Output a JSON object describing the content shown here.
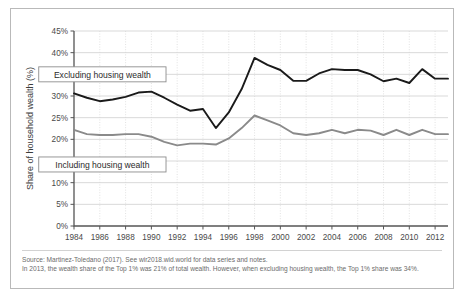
{
  "chart_data": {
    "type": "line",
    "title": "",
    "xlabel": "",
    "ylabel": "Share of household wealth (%)",
    "xlim": [
      1984,
      2013
    ],
    "ylim": [
      0,
      45
    ],
    "grid": true,
    "legend_position": "inline-annotation",
    "x": [
      1984,
      1985,
      1986,
      1987,
      1988,
      1989,
      1990,
      1991,
      1992,
      1993,
      1994,
      1995,
      1996,
      1997,
      1998,
      1999,
      2000,
      2001,
      2002,
      2003,
      2004,
      2005,
      2006,
      2007,
      2008,
      2009,
      2010,
      2011,
      2012,
      2013
    ],
    "x_tick_labels": [
      "1984",
      "1986",
      "1988",
      "1990",
      "1992",
      "1994",
      "1996",
      "1998",
      "2000",
      "2002",
      "2004",
      "2006",
      "2008",
      "2010",
      "2012"
    ],
    "x_ticks": [
      1984,
      1986,
      1988,
      1990,
      1992,
      1994,
      1996,
      1998,
      2000,
      2002,
      2004,
      2006,
      2008,
      2010,
      2012
    ],
    "y_ticks": [
      0,
      5,
      10,
      15,
      20,
      25,
      30,
      35,
      40,
      45
    ],
    "y_tick_labels": [
      "0%",
      "5%",
      "10%",
      "15%",
      "20%",
      "25%",
      "30%",
      "35%",
      "40%",
      "45%"
    ],
    "series": [
      {
        "name": "Excluding housing wealth",
        "color": "#1a1a1a",
        "width": 1.9,
        "values": [
          30.6,
          29.6,
          28.8,
          29.2,
          29.8,
          30.8,
          31.0,
          29.6,
          28.0,
          26.6,
          27.0,
          22.6,
          26.2,
          31.6,
          38.8,
          37.2,
          36.0,
          33.5,
          33.5,
          35.2,
          36.2,
          36.0,
          36.0,
          35.0,
          33.4,
          34.0,
          33.0,
          36.2,
          34.0,
          34.0
        ]
      },
      {
        "name": "Including housing wealth",
        "color": "#8a8a8a",
        "width": 1.9,
        "values": [
          22.2,
          21.2,
          21.0,
          21.0,
          21.2,
          21.2,
          20.6,
          19.4,
          18.6,
          19.0,
          19.0,
          18.8,
          20.2,
          22.6,
          25.5,
          24.4,
          23.2,
          21.4,
          21.0,
          21.4,
          22.2,
          21.4,
          22.2,
          22.0,
          21.0,
          22.2,
          21.0,
          22.2,
          21.2,
          21.2
        ]
      }
    ],
    "annotations": [
      {
        "text": "Excluding housing wealth",
        "x": 1986.2,
        "y": 35.0
      },
      {
        "text": "Including housing wealth",
        "x": 1986.2,
        "y": 14.2
      }
    ]
  },
  "footnote": {
    "line1": "Source: Martinez-Toledano (2017). See wir2018.wid.world for data series and notes.",
    "line2": "In 2013, the wealth share of the Top 1% was 21% of total wealth. However, when excluding housing wealth, the Top 1% share was 34%."
  },
  "colors": {
    "excluding": "#1a1a1a",
    "including": "#8a8a8a",
    "grid": "#c8c8c8",
    "axis": "#555555",
    "border": "#b9b9b9"
  }
}
